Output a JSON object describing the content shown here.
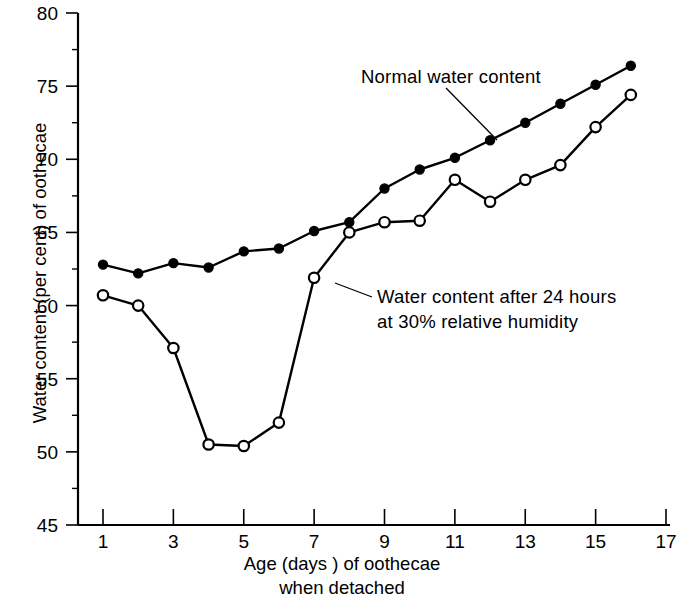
{
  "chart_data": {
    "type": "line",
    "title": "",
    "xlabel": "Age (days ) of oothecae when detached",
    "ylabel": "Water content (per cent) of oothecae",
    "xlim": [
      0,
      17.4
    ],
    "ylim": [
      45,
      80
    ],
    "grid": false,
    "legend_position": "inline-annotations",
    "x_ticks": [
      1,
      3,
      5,
      7,
      9,
      11,
      13,
      15,
      17
    ],
    "x_tick_labels": [
      "1",
      "3",
      "5",
      "7",
      "9",
      "11",
      "13",
      "15",
      "17"
    ],
    "x_minor_ticks": [
      2,
      4,
      6,
      8,
      10,
      12,
      14,
      16
    ],
    "y_ticks": [
      45,
      50,
      55,
      60,
      65,
      70,
      75,
      80
    ],
    "y_tick_labels": [
      "45",
      "50",
      "55",
      "60",
      "65",
      "70",
      "75",
      "80"
    ],
    "y_minor_ticks": [
      47.5,
      52.5,
      57.5,
      62.5,
      67.5,
      72.5,
      77.5
    ],
    "series": [
      {
        "name": "Normal water content",
        "marker": "filled-circle",
        "x": [
          1,
          2,
          3,
          4,
          5,
          6,
          7,
          8,
          9,
          10,
          11,
          12,
          13,
          14,
          15,
          16
        ],
        "values": [
          62.8,
          62.2,
          62.9,
          62.6,
          63.7,
          63.9,
          65.1,
          65.7,
          68.0,
          69.3,
          70.1,
          71.3,
          72.5,
          73.8,
          75.1,
          76.4
        ]
      },
      {
        "name": "Water content after 24 hours at 30% relative humidity",
        "marker": "open-circle",
        "x": [
          1,
          2,
          3,
          4,
          5,
          6,
          7,
          8,
          9,
          10,
          11,
          12,
          13,
          14,
          15,
          16
        ],
        "values": [
          60.7,
          60.0,
          57.1,
          50.5,
          50.4,
          52.0,
          61.9,
          65.0,
          65.7,
          65.8,
          68.6,
          67.1,
          68.6,
          69.6,
          72.2,
          74.4
        ]
      }
    ],
    "annotations": [
      {
        "name": "normal-series-label",
        "text": "Normal water content"
      },
      {
        "name": "dry-series-label-line1",
        "text": "Water content after 24 hours"
      },
      {
        "name": "dry-series-label-line2",
        "text": "at 30% relative humidity"
      }
    ]
  },
  "axes": {
    "x_title_line1": "Age (days ) of oothecae",
    "x_title_line2": "when detached",
    "y_title": "Water content (per cent) of oothecae"
  },
  "colors": {
    "ink": "#000000",
    "background": "#ffffff",
    "marker_fill_open": "#ffffff"
  }
}
